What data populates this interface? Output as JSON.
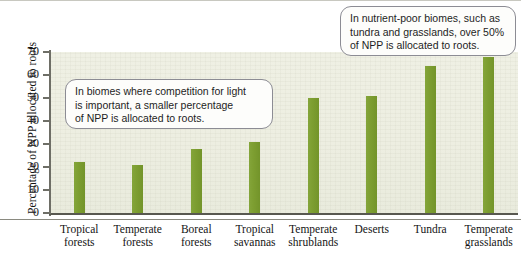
{
  "chart_data": {
    "type": "bar",
    "title": "",
    "xlabel": "",
    "ylabel": "Percentage of NPP allocated to roots",
    "ylim": [
      0,
      70
    ],
    "ytick_step": 10,
    "yticks": [
      "70",
      "60",
      "50",
      "40",
      "30",
      "20",
      "10",
      "0"
    ],
    "grid": false,
    "legend": "none",
    "bar_color": "#7d9e31",
    "plot_background": "#edeee1",
    "categories": [
      "Tropical forests",
      "Temperate forests",
      "Boreal forests",
      "Tropical savannas",
      "Temperate shrublands",
      "Deserts",
      "Tundra",
      "Temperate grasslands"
    ],
    "category_lines": [
      [
        "Tropical",
        "forests"
      ],
      [
        "Temperate",
        "forests"
      ],
      [
        "Boreal",
        "forests"
      ],
      [
        "Tropical",
        "savannas"
      ],
      [
        "Temperate",
        "shrublands"
      ],
      [
        "Deserts",
        ""
      ],
      [
        "Tundra",
        ""
      ],
      [
        "Temperate",
        "grasslands"
      ]
    ],
    "values": [
      22,
      21,
      28,
      31,
      50,
      51,
      64,
      68
    ],
    "annotations": [
      {
        "id": "callout-left",
        "lines": [
          "In biomes where competition for light",
          "is important, a smaller percentage",
          "of NPP is allocated to roots."
        ]
      },
      {
        "id": "callout-right",
        "lines": [
          "In nutrient-poor biomes, such as",
          "tundra and grasslands, over 50%",
          "of NPP is allocated to roots."
        ]
      }
    ]
  }
}
